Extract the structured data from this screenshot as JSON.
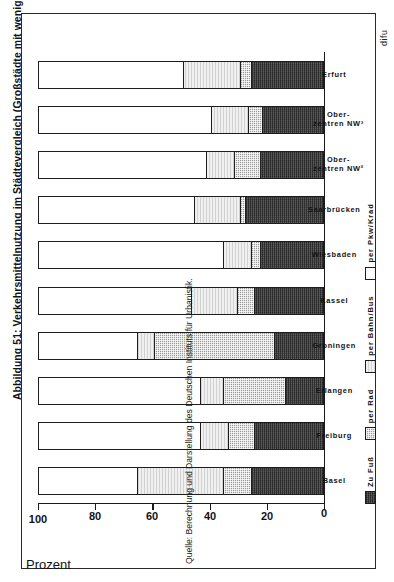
{
  "figure": {
    "title": "Abbildung 51:  Verkehrsmittelnutzung im Städtevergleich (Großstädte mit weniger als 300.000 Einwohnern)¹*",
    "source_note": "Quelle: Berechnung und Darstellung des Deutschen Instituts für Urbanistik.",
    "publisher_mark": "difu"
  },
  "axis": {
    "y_label": "Prozent",
    "y_ticks": [
      "0",
      "20",
      "40",
      "60",
      "80",
      "100"
    ],
    "y_min": 0,
    "y_max": 100
  },
  "legend": {
    "items": [
      {
        "label": "Zu Fuß",
        "swatch": "dark-hatch",
        "color": "#4a4a4a"
      },
      {
        "label": "per Rad",
        "swatch": "light-stipple",
        "color": "#9a9a9a"
      },
      {
        "label": "per Bahn/Bus",
        "swatch": "pale-gray",
        "color": "#f0f0f0"
      },
      {
        "label": "per Pkw/Krad",
        "swatch": "white",
        "color": "#ffffff"
      }
    ]
  },
  "chart_data": {
    "type": "bar",
    "title": "Verkehrsmittelnutzung im Städtevergleich (Großstädte mit weniger als 300.000 Einwohnern)",
    "xlabel": "",
    "ylabel": "Prozent",
    "ylim": [
      0,
      100
    ],
    "stacked": true,
    "grid": false,
    "legend_position": "bottom",
    "categories": [
      "Basel",
      "Freiburg",
      "Erlangen",
      "Groningen",
      "Kassel",
      "Wiesbaden",
      "Saarbrücken",
      "Oberzentren NW²",
      "Oberzentren NW³",
      "Erfurt"
    ],
    "category_labels": [
      "Basel",
      "Freiburg",
      "Erlangen",
      "Groningen",
      "Kassel",
      "Wiesbaden",
      "Saarbrücken",
      "Ober-\nzentren NW²",
      "Ober-\nzentren NW³",
      "Erfurt"
    ],
    "series": [
      {
        "name": "Zu Fuß",
        "values": [
          25,
          24,
          13,
          17,
          24,
          22,
          27,
          22,
          21,
          25
        ]
      },
      {
        "name": "per Rad",
        "values": [
          10,
          9,
          22,
          42,
          6,
          3,
          2,
          9,
          5,
          4
        ]
      },
      {
        "name": "per Bahn/Bus",
        "values": [
          30,
          10,
          8,
          6,
          16,
          10,
          16,
          10,
          13,
          20
        ]
      },
      {
        "name": "per Pkw/Krad",
        "values": [
          35,
          57,
          57,
          35,
          54,
          65,
          55,
          59,
          61,
          51
        ]
      }
    ]
  }
}
